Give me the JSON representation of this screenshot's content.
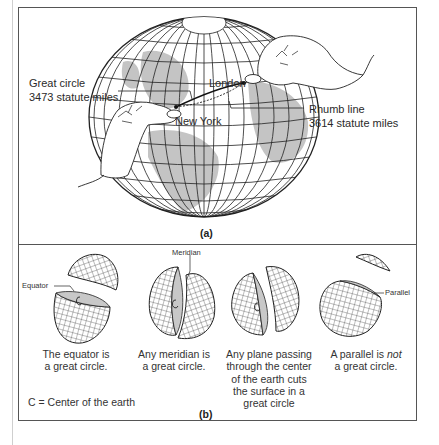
{
  "figure": {
    "panel_a": {
      "label": "(a)",
      "great_circle": {
        "title": "Great circle",
        "distance": "3473 statute miles"
      },
      "rhumb_line": {
        "title": "Rhumb line",
        "distance": "3614 statute miles"
      },
      "cities": {
        "origin": "New York",
        "destination": "London"
      }
    },
    "panel_b": {
      "label": "(b)",
      "legend": "C = Center of the earth",
      "center_marker": "C",
      "items": [
        {
          "callout": "Equator",
          "caption_line1": "The equator is",
          "caption_line2": "a great circle."
        },
        {
          "callout": "Meridian",
          "caption_line1": "Any meridian is",
          "caption_line2": "a great circle."
        },
        {
          "callout": "",
          "caption_line1": "Any plane passing",
          "caption_line2": "through the center",
          "caption_line3": "of the earth cuts",
          "caption_line4": "the surface in a",
          "caption_line5": "great circle"
        },
        {
          "callout": "Parallel",
          "caption_prefix": "A parallel is ",
          "caption_emph": "not",
          "caption_line2": "a great circle."
        }
      ]
    },
    "colors": {
      "line": "#2a2a2a",
      "land_shade": "#c4c4c4",
      "frame": "#555555"
    }
  }
}
